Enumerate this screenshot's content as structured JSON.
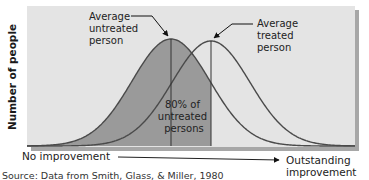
{
  "chart_data": {
    "type": "area",
    "title": "",
    "xlabel_left": "No improvement",
    "xlabel_right": [
      "Outstanding",
      "improvement"
    ],
    "ylabel": "Number of people",
    "series": [
      {
        "name": "Untreated persons",
        "distribution": "normal",
        "mean_rel": 0.0,
        "sd_rel": 1.0,
        "peak_rel": 1.0,
        "shaded_up_to": "treated_mean"
      },
      {
        "name": "Treated persons",
        "distribution": "normal",
        "mean_rel": 0.85,
        "sd_rel": 1.0,
        "peak_rel": 0.98
      }
    ],
    "annotations": [
      {
        "text": [
          "Average",
          "untreated",
          "person"
        ],
        "points_to": "untreated_mean"
      },
      {
        "text": [
          "Average",
          "treated",
          "person"
        ],
        "points_to": "treated_mean"
      },
      {
        "text": [
          "80% of",
          "untreated",
          "persons"
        ],
        "region": "shaded area left of treated mean"
      }
    ],
    "shaded_percent": 80,
    "grid": false,
    "legend": null
  },
  "geometry": {
    "panel": {
      "x": 27,
      "y": 6,
      "w": 328,
      "h": 141
    },
    "baseline": 146,
    "untreated": {
      "mu": 171,
      "sigma": 39,
      "height": 107
    },
    "treated": {
      "mu": 211,
      "sigma": 39,
      "height": 105
    },
    "colors": {
      "panel": "#e4e4e4",
      "shade": "#9a9a9a",
      "curve": "#4a4a4a",
      "shadow": "#8a8a8a"
    }
  },
  "labels": {
    "ylabel": "Number of people",
    "ann_untreated": [
      "Average",
      "untreated",
      "person"
    ],
    "ann_treated": [
      "Average",
      "treated",
      "person"
    ],
    "ann_percent": [
      "80% of",
      "untreated",
      "persons"
    ],
    "x_left": "No improvement",
    "x_right_1": "Outstanding",
    "x_right_2": "improvement",
    "source": "Source: Data from Smith, Glass, & Miller, 1980"
  }
}
